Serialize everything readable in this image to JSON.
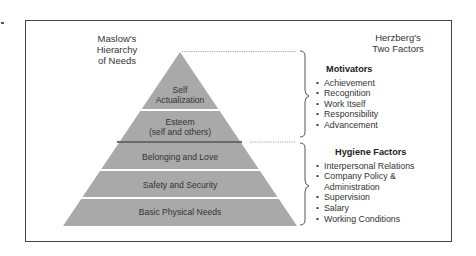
{
  "maslow": {
    "title_lines": [
      "Maslow's",
      "Hierarchy",
      "of Needs"
    ],
    "layers": [
      {
        "label_lines": [
          "Self",
          "Actualization"
        ]
      },
      {
        "label_lines": [
          "Esteem",
          "(self and others)"
        ]
      },
      {
        "label_lines": [
          "Belonging and Love"
        ]
      },
      {
        "label_lines": [
          "Safety and Security"
        ]
      },
      {
        "label_lines": [
          "Basic Physical Needs"
        ]
      }
    ]
  },
  "herzberg": {
    "title_lines": [
      "Herzberg's",
      "Two Factors"
    ],
    "motivators": {
      "title": "Motivators",
      "items": [
        "Achievement",
        "Recognition",
        "Work Itself",
        "Responsibility",
        "Advancement"
      ]
    },
    "hygiene": {
      "title": "Hygiene Factors",
      "items": [
        "Interpersonal Relations",
        "Company Policy &",
        "Administration",
        "Supervision",
        "Salary",
        "Working Conditions"
      ]
    }
  },
  "colors": {
    "pyramid_fill": "#a9a9a9",
    "divider": "#ffffff",
    "key_divider": "#6a6a6a",
    "frame": "#444444"
  }
}
